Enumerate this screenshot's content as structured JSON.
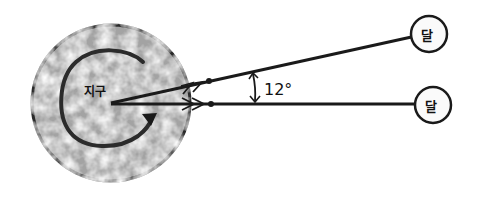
{
  "diagram": {
    "earth": {
      "label": "지구",
      "fill": "#9e9e9e",
      "stroke": "#2a2a2a"
    },
    "moons": [
      {
        "label": "달",
        "position": "upper"
      },
      {
        "label": "달",
        "position": "lower"
      }
    ],
    "angle": {
      "label": "12°"
    },
    "colors": {
      "ink": "#1a1a1a",
      "background": "#ffffff"
    }
  }
}
